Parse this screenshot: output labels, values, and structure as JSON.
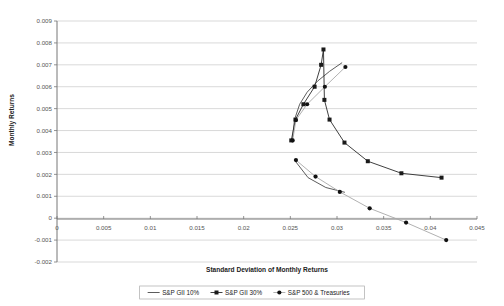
{
  "chart_data": {
    "type": "scatter",
    "title": "",
    "xlabel": "Standard Deviation of Monthly Returns",
    "ylabel": "Monthly Returns",
    "xlim": [
      0,
      0.045
    ],
    "ylim": [
      -0.002,
      0.009
    ],
    "xticks": [
      "0",
      "0.005",
      "0.01",
      "0.015",
      "0.02",
      "0.025",
      "0.03",
      "0.035",
      "0.04",
      "0.045"
    ],
    "xtick_values": [
      0,
      0.005,
      0.01,
      0.015,
      0.02,
      0.025,
      0.03,
      0.035,
      0.04,
      0.045
    ],
    "yticks": [
      "0.009",
      "0.008",
      "0.007",
      "0.006",
      "0.005",
      "0.004",
      "0.003",
      "0.002",
      "0.001",
      "0",
      "-0.001",
      "-0.002"
    ],
    "ytick_values": [
      0.009,
      0.008,
      0.007,
      0.006,
      0.005,
      0.004,
      0.003,
      0.002,
      0.001,
      0,
      -0.001,
      -0.002
    ],
    "grid": "horizontal",
    "legend_position": "bottom",
    "series": [
      {
        "name": "S&P GII 10%",
        "marker": "none",
        "color": "#3a3a3a",
        "points": [
          {
            "x": 0.0252,
            "y": 0.00355
          },
          {
            "x": 0.02545,
            "y": 0.0045
          },
          {
            "x": 0.026,
            "y": 0.0052
          },
          {
            "x": 0.0268,
            "y": 0.00575
          },
          {
            "x": 0.0279,
            "y": 0.00625
          },
          {
            "x": 0.0292,
            "y": 0.0067
          },
          {
            "x": 0.03055,
            "y": 0.0071
          },
          {
            "x": 0.02545,
            "y": 0.00265
          },
          {
            "x": 0.0269,
            "y": 0.00185
          },
          {
            "x": 0.0288,
            "y": 0.0014
          },
          {
            "x": 0.03085,
            "y": 0.00118
          }
        ]
      },
      {
        "name": "S&P GII 30%",
        "marker": "square",
        "color": "#1f1f1f",
        "points": [
          {
            "x": 0.0251,
            "y": 0.00355
          },
          {
            "x": 0.02555,
            "y": 0.0045
          },
          {
            "x": 0.0264,
            "y": 0.0052
          },
          {
            "x": 0.0276,
            "y": 0.006
          },
          {
            "x": 0.0283,
            "y": 0.007
          },
          {
            "x": 0.02855,
            "y": 0.0077
          },
          {
            "x": 0.02865,
            "y": 0.0054
          },
          {
            "x": 0.0292,
            "y": 0.0045
          },
          {
            "x": 0.0308,
            "y": 0.00345
          },
          {
            "x": 0.0333,
            "y": 0.0026
          },
          {
            "x": 0.0369,
            "y": 0.00205
          },
          {
            "x": 0.0412,
            "y": 0.00185
          }
        ]
      },
      {
        "name": "S&P 500 & Treasuries",
        "marker": "circle",
        "color": "#111111",
        "points": [
          {
            "x": 0.02525,
            "y": 0.00355
          },
          {
            "x": 0.0256,
            "y": 0.00448
          },
          {
            "x": 0.0268,
            "y": 0.0052
          },
          {
            "x": 0.0287,
            "y": 0.006
          },
          {
            "x": 0.0309,
            "y": 0.0069
          },
          {
            "x": 0.0256,
            "y": 0.00265
          },
          {
            "x": 0.0277,
            "y": 0.0019
          },
          {
            "x": 0.0303,
            "y": 0.0012
          },
          {
            "x": 0.0335,
            "y": 0.00045
          },
          {
            "x": 0.0374,
            "y": -0.0002
          },
          {
            "x": 0.0417,
            "y": -0.001
          }
        ]
      }
    ]
  },
  "legend": {
    "items": [
      {
        "label": "S&P GII 10%",
        "marker": "line"
      },
      {
        "label": "S&P GII 30%",
        "marker": "square"
      },
      {
        "label": "S&P 500 & Treasuries",
        "marker": "circle"
      }
    ]
  },
  "colors": {
    "grid": "#c9c9c9",
    "axis": "#808080",
    "series_dark": "#2a2a2a",
    "series_mid": "#555555",
    "series_light": "#9a9a9a",
    "background": "#ffffff"
  }
}
